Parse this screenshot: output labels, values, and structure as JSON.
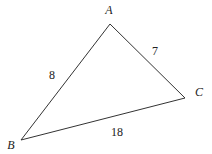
{
  "diagram": {
    "type": "triangle",
    "line_color": "#333333",
    "vertices": [
      {
        "name": "A",
        "x": 110,
        "y": 24,
        "label_x": 109,
        "label_y": 11
      },
      {
        "name": "B",
        "x": 21,
        "y": 140,
        "label_x": 11,
        "label_y": 148
      },
      {
        "name": "C",
        "x": 185,
        "y": 98,
        "label_x": 199,
        "label_y": 95
      }
    ],
    "sides": [
      {
        "from": "A",
        "to": "B",
        "length": "8",
        "label_x": 52,
        "label_y": 79
      },
      {
        "from": "A",
        "to": "C",
        "length": "7",
        "label_x": 155,
        "label_y": 55
      },
      {
        "from": "B",
        "to": "C",
        "length": "18",
        "label_x": 117,
        "label_y": 136
      }
    ]
  }
}
